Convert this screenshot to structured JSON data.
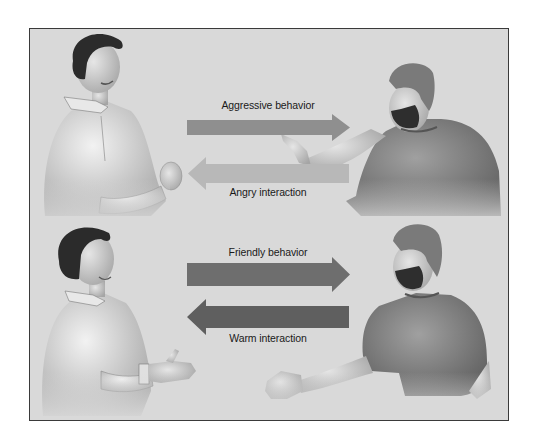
{
  "diagram": {
    "top_panel": {
      "outgoing": {
        "label": "Aggressive behavior",
        "direction": "right",
        "color": "#8f8f8f"
      },
      "incoming": {
        "label": "Angry interaction",
        "direction": "left",
        "color": "#b8b8b8"
      },
      "left_person": {
        "description": "man with clenched fist, aggressive expression"
      },
      "right_person": {
        "description": "bearded man pointing finger"
      }
    },
    "bottom_panel": {
      "outgoing": {
        "label": "Friendly behavior",
        "direction": "right",
        "color": "#6e6e6e"
      },
      "incoming": {
        "label": "Warm interaction",
        "direction": "left",
        "color": "#5f5f5f"
      },
      "left_person": {
        "description": "smiling man extending hand"
      },
      "right_person": {
        "description": "bearded man extending hand for handshake"
      }
    }
  }
}
